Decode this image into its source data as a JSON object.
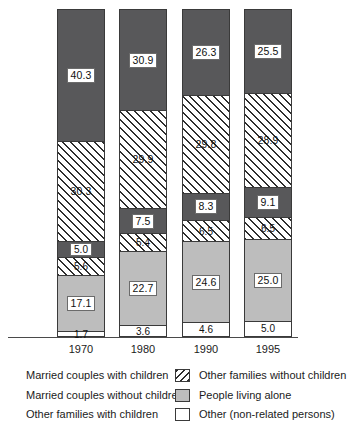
{
  "chart_data": {
    "type": "bar",
    "subtype": "stacked-percentage",
    "title": "",
    "xlabel": "",
    "ylabel": "",
    "ylim": [
      0,
      100
    ],
    "grid": false,
    "legend_position": "bottom",
    "categories": [
      "1970",
      "1980",
      "1990",
      "1995"
    ],
    "series": [
      {
        "name": "Other (non-related persons)",
        "key": "other_nonrelated",
        "fill": "white",
        "values": [
          1.7,
          3.6,
          4.6,
          5.0
        ]
      },
      {
        "name": "People living alone",
        "key": "living_alone",
        "fill": "gray",
        "values": [
          17.1,
          22.7,
          24.6,
          25.0
        ]
      },
      {
        "name": "Other families with children",
        "key": "other_fam_kids",
        "fill": "hatch",
        "values": [
          5.6,
          5.4,
          6.5,
          6.5
        ]
      },
      {
        "name": "Married couples without children",
        "key": "mc_no_kids",
        "fill": "dark",
        "values": [
          5.0,
          7.5,
          8.3,
          9.1
        ]
      },
      {
        "name": "Other families without children",
        "key": "other_fam_nokids",
        "fill": "hatch",
        "values": [
          30.3,
          29.9,
          29.8,
          28.9
        ]
      },
      {
        "name": "Married couples with children",
        "key": "mc_kids",
        "fill": "dark",
        "values": [
          40.3,
          30.9,
          26.3,
          25.5
        ]
      }
    ],
    "bars": [
      {
        "year": "1970",
        "segments": [
          {
            "label": "40.3",
            "fill": "dark",
            "value": 40.3,
            "boxed": true
          },
          {
            "label": "30.3",
            "fill": "hatch",
            "value": 30.3,
            "boxed": false
          },
          {
            "label": "5.0",
            "fill": "dark",
            "value": 5.0,
            "boxed": true
          },
          {
            "label": "5.6",
            "fill": "hatch",
            "value": 5.6,
            "boxed": false
          },
          {
            "label": "17.1",
            "fill": "gray",
            "value": 17.1,
            "boxed": true
          },
          {
            "label": "1.7",
            "fill": "white",
            "value": 1.7,
            "boxed": false
          }
        ]
      },
      {
        "year": "1980",
        "segments": [
          {
            "label": "30.9",
            "fill": "dark",
            "value": 30.9,
            "boxed": true
          },
          {
            "label": "29.9",
            "fill": "hatch",
            "value": 29.9,
            "boxed": false
          },
          {
            "label": "7.5",
            "fill": "dark",
            "value": 7.5,
            "boxed": true
          },
          {
            "label": "5.4",
            "fill": "hatch",
            "value": 5.4,
            "boxed": false
          },
          {
            "label": "22.7",
            "fill": "gray",
            "value": 22.7,
            "boxed": true
          },
          {
            "label": "3.6",
            "fill": "white",
            "value": 3.6,
            "boxed": false
          }
        ]
      },
      {
        "year": "1990",
        "segments": [
          {
            "label": "26.3",
            "fill": "dark",
            "value": 26.3,
            "boxed": true
          },
          {
            "label": "29.8",
            "fill": "hatch",
            "value": 29.8,
            "boxed": false
          },
          {
            "label": "8.3",
            "fill": "dark",
            "value": 8.3,
            "boxed": true
          },
          {
            "label": "6.5",
            "fill": "hatch",
            "value": 6.5,
            "boxed": false
          },
          {
            "label": "24.6",
            "fill": "gray",
            "value": 24.6,
            "boxed": true
          },
          {
            "label": "4.6",
            "fill": "white",
            "value": 4.6,
            "boxed": false
          }
        ]
      },
      {
        "year": "1995",
        "segments": [
          {
            "label": "25.5",
            "fill": "dark",
            "value": 25.5,
            "boxed": true
          },
          {
            "label": "28.9",
            "fill": "hatch",
            "value": 28.9,
            "boxed": false
          },
          {
            "label": "9.1",
            "fill": "dark",
            "value": 9.1,
            "boxed": true
          },
          {
            "label": "6.5",
            "fill": "hatch",
            "value": 6.5,
            "boxed": false
          },
          {
            "label": "25.0",
            "fill": "gray",
            "value": 25.0,
            "boxed": true
          },
          {
            "label": "5.0",
            "fill": "white",
            "value": 5.0,
            "boxed": false
          }
        ]
      }
    ]
  },
  "axis": {
    "ticks": [
      "1970",
      "1980",
      "1990",
      "1995"
    ]
  },
  "legend": {
    "left": [
      {
        "label": "Married couples with children",
        "swatch": "dark"
      },
      {
        "label": "Married couples without children",
        "swatch": "dark"
      },
      {
        "label": "Other families with children",
        "swatch": "hatch"
      }
    ],
    "right": [
      {
        "label": "Other families without children",
        "swatch": "hatch"
      },
      {
        "label": "People living alone",
        "swatch": "gray"
      },
      {
        "label": "Other (non-related persons)",
        "swatch": "white"
      }
    ]
  },
  "colors": {
    "dark_gray": "#58585a",
    "light_gray": "#bdbdbd",
    "white": "#ffffff",
    "hatch_line": "#2e2e2e",
    "outline": "#3a3a3a",
    "text": "#1b1b1b"
  }
}
